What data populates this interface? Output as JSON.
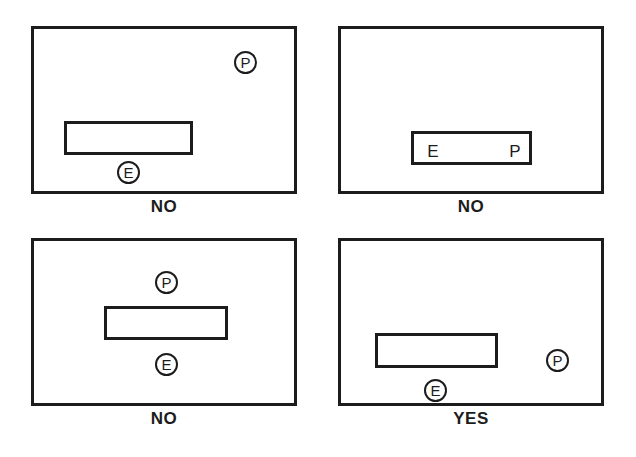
{
  "figure": {
    "type": "diagram",
    "title": "",
    "background_color": "#ffffff",
    "line_color": "#1c1c1c",
    "marker_labels": {
      "entry": "E",
      "pick": "P"
    }
  },
  "panels": [
    {
      "id": "panel-top-left",
      "caption": "NO",
      "bar": {
        "label": ""
      },
      "markers": [
        {
          "name": "p-marker",
          "label": "P",
          "style": "circled",
          "position": "top-right"
        },
        {
          "name": "e-marker",
          "label": "E",
          "style": "circled",
          "position": "below-bar-left"
        }
      ]
    },
    {
      "id": "panel-top-right",
      "caption": "NO",
      "bar": {
        "label": ""
      },
      "markers": [
        {
          "name": "e-marker",
          "label": "E",
          "style": "plain",
          "position": "inside-bar-left"
        },
        {
          "name": "p-marker",
          "label": "P",
          "style": "plain",
          "position": "inside-bar-right"
        }
      ]
    },
    {
      "id": "panel-bottom-left",
      "caption": "NO",
      "bar": {
        "label": ""
      },
      "markers": [
        {
          "name": "p-marker",
          "label": "P",
          "style": "circled",
          "position": "above-bar-center"
        },
        {
          "name": "e-marker",
          "label": "E",
          "style": "circled",
          "position": "below-bar-center"
        }
      ]
    },
    {
      "id": "panel-bottom-right",
      "caption": "YES",
      "bar": {
        "label": ""
      },
      "markers": [
        {
          "name": "e-marker",
          "label": "E",
          "style": "circled",
          "position": "below-bar-left"
        },
        {
          "name": "p-marker",
          "label": "P",
          "style": "circled",
          "position": "right-of-bar"
        }
      ]
    }
  ]
}
